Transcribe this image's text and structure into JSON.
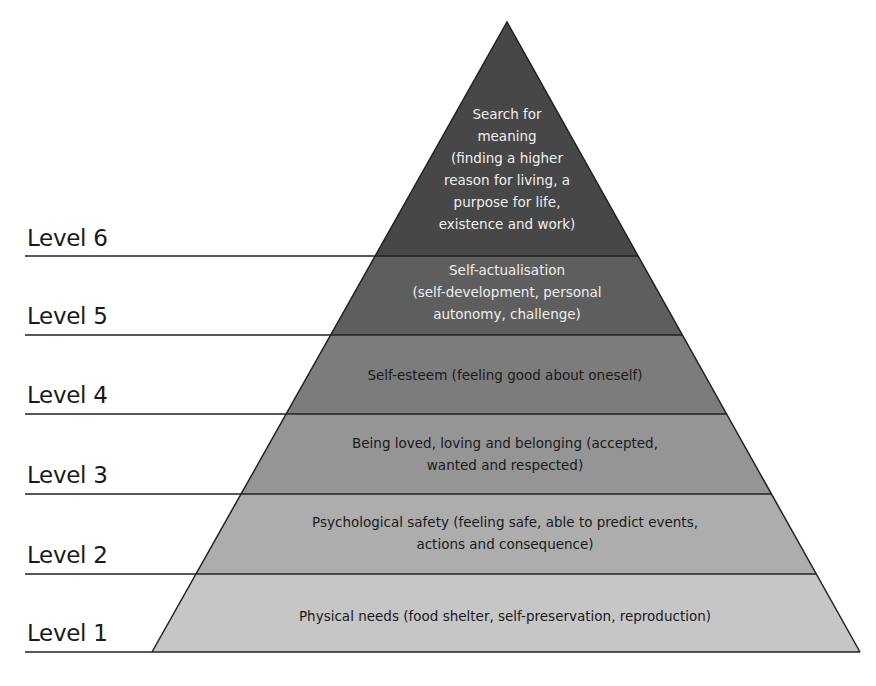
{
  "diagram": {
    "title": "",
    "levels": [
      {
        "label": "Level 1",
        "text_lines": [
          "Physical needs (food shelter, self-preservation, reproduction)"
        ],
        "fill": "#c6c6c6",
        "text_color": "#1a1a1a"
      },
      {
        "label": "Level 2",
        "text_lines": [
          "Psychological safety (feeling safe, able to predict events,",
          "actions and consequence)"
        ],
        "fill": "#adadad",
        "text_color": "#1a1a1a"
      },
      {
        "label": "Level 3",
        "text_lines": [
          "Being loved, loving and belonging (accepted,",
          "wanted and respected)"
        ],
        "fill": "#959595",
        "text_color": "#1a1a1a"
      },
      {
        "label": "Level 4",
        "text_lines": [
          "Self-esteem (feeling good about oneself)"
        ],
        "fill": "#7c7c7c",
        "text_color": "#1a1a1a"
      },
      {
        "label": "Level 5",
        "text_lines": [
          "Self-actualisation",
          "(self-development, personal",
          "autonomy, challenge)"
        ],
        "fill": "#5e5e5e",
        "text_color": "#efefef"
      },
      {
        "label": "Level 6",
        "text_lines": [
          "Search for",
          "meaning",
          "(finding a higher",
          "reason for living, a",
          "purpose for life,",
          "existence and work)"
        ],
        "fill": "#474747",
        "text_color": "#efefef"
      }
    ]
  }
}
